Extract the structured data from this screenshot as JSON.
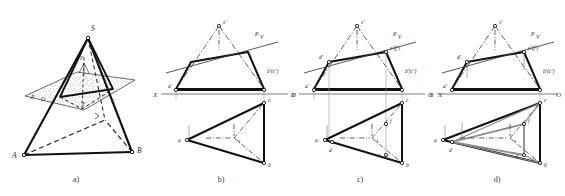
{
  "figure": {
    "caption_a": "a)",
    "caption_b": "b)",
    "caption_c": "c)",
    "caption_d": "d)",
    "background": "#ffffff",
    "ink": "#1a1a1a",
    "section_color": "#8c8c8c",
    "thin_color": "#6e6e6e"
  },
  "panel_a": {
    "title": "pictorial-pyramid-cut-by-plane",
    "labels": {
      "apex": "S",
      "base_left": "A",
      "base_right": "B",
      "plane": "P",
      "cut_left": "D",
      "cut_right": "C",
      "cut_front": "E",
      "cut_top": "F"
    }
  },
  "panel_b": {
    "title": "two-view-projection-of-pyramid",
    "axis_left": "X",
    "axis_right": "O",
    "labels": {
      "apex_front": "s'",
      "plane_trace": "P",
      "plane_trace_sub": "V",
      "a_front": "a'",
      "bc_front": "b'(c')",
      "a_top": "a",
      "b_top": "b",
      "c_top": "c",
      "s_top": "s"
    }
  },
  "panel_c": {
    "title": "section-points-construction",
    "axis_left": "X",
    "axis_right": "O",
    "axis_far_right": "X",
    "labels": {
      "apex_front": "s'",
      "plane_trace": "P",
      "plane_trace_sub": "V",
      "d_front": "d'",
      "ef_front": "e'(f')",
      "a_front": "a'",
      "bc_front": "b'(c')",
      "a_top": "a",
      "b_top": "b",
      "c_top": "c",
      "s_top": "s",
      "d_top": "d",
      "e_top": "e",
      "f_top": "f"
    }
  },
  "panel_d": {
    "title": "completed-section-triangle",
    "axis_left": "X",
    "axis_right": "O",
    "labels": {
      "apex_front": "s'",
      "plane_trace": "P",
      "plane_trace_sub": "V",
      "d_front": "d'",
      "ef_front": "e'(f')",
      "a_front": "a'",
      "bc_front": "b'(c')",
      "a_top": "a",
      "b_top": "b",
      "c_top": "c",
      "s_top": "s",
      "d_top": "d",
      "e_top": "e",
      "f_top": "f"
    }
  }
}
